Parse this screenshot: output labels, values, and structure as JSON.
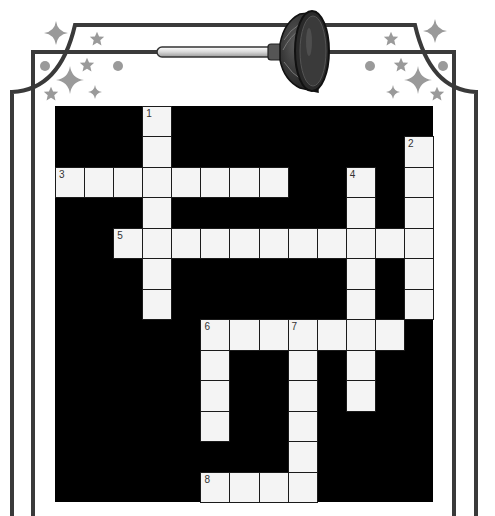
{
  "puzzle": {
    "type": "crossword",
    "theme_icon": "plunger-icon",
    "grid": {
      "rows": 13,
      "cols": 13,
      "cell_color": "#f4f4f4",
      "block_color": "#000000"
    },
    "entries": [
      {
        "number": "1",
        "direction": "down",
        "row": 0,
        "col": 3,
        "length": 7
      },
      {
        "number": "2",
        "direction": "down",
        "row": 1,
        "col": 12,
        "length": 6
      },
      {
        "number": "3",
        "direction": "across",
        "row": 2,
        "col": 0,
        "length": 8
      },
      {
        "number": "4",
        "direction": "down",
        "row": 2,
        "col": 10,
        "length": 8
      },
      {
        "number": "5",
        "direction": "across",
        "row": 4,
        "col": 2,
        "length": 11
      },
      {
        "number": "6",
        "direction": "across",
        "row": 7,
        "col": 5,
        "length": 7
      },
      {
        "number": "6",
        "direction": "down",
        "row": 7,
        "col": 5,
        "length": 4
      },
      {
        "number": "7",
        "direction": "down",
        "row": 7,
        "col": 8,
        "length": 6
      },
      {
        "number": "8",
        "direction": "across",
        "row": 12,
        "col": 5,
        "length": 4
      }
    ]
  },
  "decorations": {
    "frame_color": "#3a3a3a",
    "ornament_color": "#9a9a9a",
    "ornaments": [
      "sparkle-icon",
      "star-icon",
      "dot-icon"
    ]
  }
}
